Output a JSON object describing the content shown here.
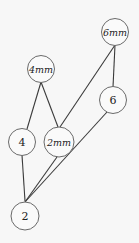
{
  "diagram": {
    "type": "hasse-diagram",
    "nodes": [
      {
        "id": "6mm",
        "label": "6mm",
        "italic": true
      },
      {
        "id": "4mm",
        "label": "4mm",
        "italic": true
      },
      {
        "id": "6",
        "label": "6",
        "italic": false
      },
      {
        "id": "4",
        "label": "4",
        "italic": false
      },
      {
        "id": "2mm",
        "label": "2mm",
        "italic": true
      },
      {
        "id": "2",
        "label": "2",
        "italic": false
      }
    ],
    "edges": [
      {
        "from": "4mm",
        "to": "4"
      },
      {
        "from": "4mm",
        "to": "2mm"
      },
      {
        "from": "6mm",
        "to": "2mm"
      },
      {
        "from": "6mm",
        "to": "6"
      },
      {
        "from": "4",
        "to": "2"
      },
      {
        "from": "2mm",
        "to": "2"
      },
      {
        "from": "6",
        "to": "2"
      }
    ]
  }
}
